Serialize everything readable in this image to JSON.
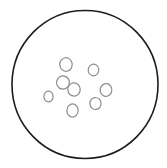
{
  "figure": {
    "title": "",
    "type": "line-drawing",
    "background_color": "#ffffff",
    "canvas": {
      "width": 167,
      "height": 168
    }
  },
  "outer_circle": {
    "name": "dish-boundary",
    "cx": 85.0,
    "cy": 84.5,
    "rx": 73.0,
    "ry": 74.0,
    "stroke_color": "#1d1d1d",
    "stroke_width": 1.6,
    "fill_color": "#ffffff"
  },
  "inner_circles": {
    "count": 8,
    "stroke_color": "#8c8c8f",
    "stroke_width": 1.2,
    "fill_color": "#ffffff",
    "items": [
      {
        "id": "colony-1",
        "label": "top",
        "cx": 66.0,
        "cy": 64.5,
        "rx": 6.2,
        "ry": 6.8,
        "rotate": -8
      },
      {
        "id": "colony-2",
        "label": "upper-right",
        "cx": 93.5,
        "cy": 70.0,
        "rx": 5.3,
        "ry": 5.8,
        "rotate": 5
      },
      {
        "id": "colony-3",
        "label": "center-left-upper",
        "cx": 63.0,
        "cy": 82.5,
        "rx": 6.4,
        "ry": 6.6,
        "rotate": 12
      },
      {
        "id": "colony-4",
        "label": "center",
        "cx": 74.0,
        "cy": 89.5,
        "rx": 6.2,
        "ry": 6.6,
        "rotate": -4
      },
      {
        "id": "colony-5",
        "label": "far-left",
        "cx": 48.5,
        "cy": 96.5,
        "rx": 4.6,
        "ry": 5.4,
        "rotate": 0
      },
      {
        "id": "colony-6",
        "label": "right",
        "cx": 106.0,
        "cy": 90.0,
        "rx": 5.8,
        "ry": 6.4,
        "rotate": 8
      },
      {
        "id": "colony-7",
        "label": "lower-right",
        "cx": 95.5,
        "cy": 103.5,
        "rx": 5.6,
        "ry": 6.0,
        "rotate": -6
      },
      {
        "id": "colony-8",
        "label": "bottom",
        "cx": 72.5,
        "cy": 110.5,
        "rx": 5.6,
        "ry": 6.6,
        "rotate": 3
      }
    ]
  }
}
